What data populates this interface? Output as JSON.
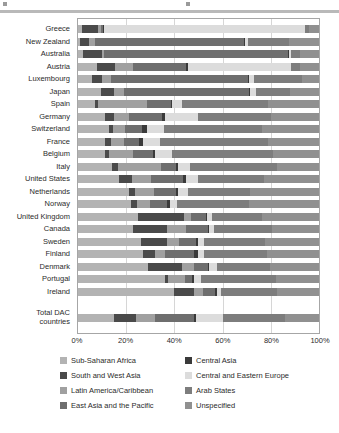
{
  "chart_data": {
    "type": "bar",
    "orientation": "horizontal",
    "stacked": true,
    "normalized": true,
    "title": "",
    "xlabel": "",
    "ylabel": "",
    "xlim": [
      0,
      100
    ],
    "xticks": [
      "0%",
      "20%",
      "40%",
      "60%",
      "80%",
      "100%"
    ],
    "xtick_values": [
      0,
      20,
      40,
      60,
      80,
      100
    ],
    "grid": true,
    "grid_axis": "x",
    "legend_position": "bottom",
    "categories": [
      "Greece",
      "New Zealand",
      "Australia",
      "Austria",
      "Luxembourg",
      "Japan",
      "Spain",
      "Germany",
      "Switzerland",
      "France",
      "Belgium",
      "Italy",
      "United States",
      "Netherlands",
      "Norway",
      "United Kingdom",
      "Canada",
      "Sweden",
      "Finland",
      "Denmark",
      "Portugal",
      "Ireland",
      "Total DAC countries"
    ],
    "series": [
      {
        "name": "Sub-Saharan Africa",
        "color": "#b3b3b3",
        "values": [
          1.5,
          1.0,
          2.0,
          8.0,
          6.0,
          9.5,
          7.0,
          11.0,
          13.0,
          11.0,
          11.0,
          14.0,
          17.0,
          21.0,
          22.0,
          25.0,
          23.0,
          26.0,
          27.0,
          29.0,
          36.0,
          40.0,
          15.0
        ]
      },
      {
        "name": "South and West Asia",
        "color": "#4a4a4a",
        "values": [
          7.0,
          3.5,
          8.0,
          7.5,
          4.0,
          5.5,
          1.5,
          4.0,
          1.5,
          2.5,
          2.0,
          2.5,
          5.5,
          2.5,
          2.5,
          19.0,
          14.0,
          11.0,
          5.0,
          14.0,
          1.5,
          8.0,
          9.0
        ]
      },
      {
        "name": "Latin America/Caribbean",
        "color": "#a0a0a0",
        "values": [
          1.0,
          2.5,
          1.0,
          7.5,
          3.5,
          4.0,
          20.0,
          6.0,
          5.0,
          5.5,
          10.0,
          18.0,
          8.0,
          8.0,
          5.5,
          3.0,
          8.0,
          5.0,
          4.0,
          5.0,
          7.0,
          4.0,
          8.0
        ]
      },
      {
        "name": "East Asia and the Pacific",
        "color": "#6e6e6e",
        "values": [
          1.0,
          62.0,
          76.0,
          22.0,
          57.0,
          52.0,
          10.0,
          14.0,
          7.0,
          6.5,
          8.0,
          6.0,
          13.0,
          9.0,
          7.0,
          6.0,
          9.0,
          7.0,
          12.0,
          6.0,
          3.0,
          5.0,
          16.0
        ]
      },
      {
        "name": "Central Asia",
        "color": "#3a3a3a",
        "values": [
          0.5,
          0.5,
          0.5,
          0.5,
          0.5,
          0.5,
          0.5,
          1.0,
          2.0,
          1.5,
          1.0,
          1.0,
          1.5,
          1.0,
          1.0,
          0.5,
          0.5,
          1.0,
          2.0,
          0.5,
          0.5,
          0.5,
          1.0
        ]
      },
      {
        "name": "Central and Eastern Europe",
        "color": "#dcdcdc",
        "values": [
          83.0,
          1.0,
          1.0,
          43.0,
          2.0,
          2.5,
          4.0,
          14.0,
          7.0,
          7.0,
          7.0,
          5.0,
          5.0,
          4.0,
          3.0,
          2.0,
          2.0,
          2.5,
          2.5,
          3.0,
          3.0,
          2.0,
          11.0
        ]
      },
      {
        "name": "Arab States",
        "color": "#7d7d7d",
        "values": [
          2.0,
          17.0,
          3.5,
          3.5,
          20.0,
          14.0,
          36.0,
          30.0,
          41.0,
          45.0,
          42.0,
          36.0,
          27.0,
          26.0,
          30.0,
          21.0,
          24.0,
          25.0,
          26.0,
          22.0,
          31.0,
          23.0,
          26.0
        ]
      },
      {
        "name": "Unspecified",
        "color": "#909090",
        "values": [
          4.0,
          12.5,
          8.0,
          8.0,
          7.0,
          12.0,
          21.0,
          20.0,
          23.5,
          21.0,
          19.0,
          17.5,
          23.0,
          28.5,
          29.0,
          23.5,
          19.5,
          22.5,
          21.5,
          20.5,
          18.0,
          17.5,
          14.0
        ]
      }
    ]
  },
  "legend": {
    "left_column": [
      {
        "label": "Sub-Saharan Africa",
        "color": "#b3b3b3"
      },
      {
        "label": "South and West Asia",
        "color": "#4a4a4a"
      },
      {
        "label": "Latin America/Caribbean",
        "color": "#a0a0a0"
      },
      {
        "label": "East Asia and the Pacific",
        "color": "#6e6e6e"
      }
    ],
    "right_column": [
      {
        "label": "Central Asia",
        "color": "#3a3a3a"
      },
      {
        "label": "Central and Eastern Europe",
        "color": "#dcdcdc"
      },
      {
        "label": "Arab States",
        "color": "#7d7d7d"
      },
      {
        "label": "Unspecified",
        "color": "#909090"
      }
    ]
  }
}
